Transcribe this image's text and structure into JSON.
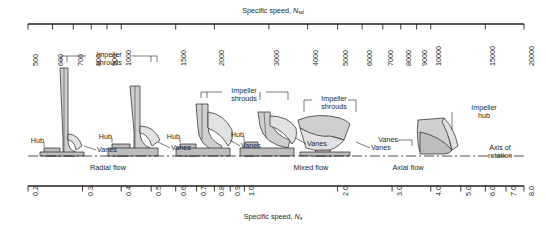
{
  "figure": {
    "top_axis": {
      "title_prefix": "Specific speed, ",
      "title_symbol": "N",
      "title_subscript": "sd",
      "ticks": [
        {
          "label": "500",
          "value": 500
        },
        {
          "label": "600",
          "value": 600
        },
        {
          "label": "700",
          "value": 700
        },
        {
          "label": "800",
          "value": 800
        },
        {
          "label": "900",
          "value": 900
        },
        {
          "label": "1000",
          "value": 1000
        },
        {
          "label": "1500",
          "value": 1500
        },
        {
          "label": "2000",
          "value": 2000
        },
        {
          "label": "3000",
          "value": 3000
        },
        {
          "label": "4000",
          "value": 4000
        },
        {
          "label": "5000",
          "value": 5000
        },
        {
          "label": "6000",
          "value": 6000
        },
        {
          "label": "7000",
          "value": 7000
        },
        {
          "label": "8000",
          "value": 8000
        },
        {
          "label": "9000",
          "value": 9000
        },
        {
          "label": "10000",
          "value": 10000
        },
        {
          "label": "15000",
          "value": 15000
        },
        {
          "label": "20000",
          "value": 20000
        }
      ]
    },
    "bottom_axis": {
      "title_prefix": "Specific speed, ",
      "title_symbol": "N",
      "title_subscript": "s",
      "ticks": [
        {
          "label": "0.2",
          "value": 0.2
        },
        {
          "label": "0.3",
          "value": 0.3
        },
        {
          "label": "0.4",
          "value": 0.4
        },
        {
          "label": "0.5",
          "value": 0.5
        },
        {
          "label": "0.6",
          "value": 0.6
        },
        {
          "label": "0.7",
          "value": 0.7
        },
        {
          "label": "0.8",
          "value": 0.8
        },
        {
          "label": "0.9",
          "value": 0.9
        },
        {
          "label": "1.0",
          "value": 1.0
        },
        {
          "label": "2.0",
          "value": 2.0
        },
        {
          "label": "3.0",
          "value": 3.0
        },
        {
          "label": "4.0",
          "value": 4.0
        },
        {
          "label": "5.0",
          "value": 5.0
        },
        {
          "label": "6.0",
          "value": 6.0
        },
        {
          "label": "7.0",
          "value": 7.0
        },
        {
          "label": "8.0",
          "value": 8.0
        }
      ]
    },
    "flow_regimes": [
      {
        "label": "Radial flow",
        "x": 108
      },
      {
        "label": "Mixed flow",
        "x": 311
      },
      {
        "label": "Axial flow",
        "x": 408
      }
    ],
    "annotations": {
      "impeller_shrouds_1": "Impeller\nshrouds",
      "impeller_shrouds_2": "Impeller\nshrouds",
      "impeller_shrouds_3": "Impeller\nshrouds",
      "impeller_hub": "Impeller\nhub",
      "axis_of_rotation": "Axis of\nrotation",
      "hub_1": "Hub",
      "hub_2": "Hub",
      "hub_3": "Hub",
      "hub_4": "Hub",
      "vanes_1": "Vanes",
      "vanes_2": "Vanes",
      "vanes_3": "Vanes",
      "vanes_4": "Vanes",
      "vanes_5": "Vanes",
      "vanes_6": "Vanes"
    },
    "colors": {
      "line": "#231f20",
      "text": "#231f20",
      "fill_light": "#e2e2e2",
      "fill_mid": "#cfcfcf",
      "fill_dark": "#bdbdbd",
      "background": "#ffffff"
    },
    "geometry": {
      "axis_left": 28,
      "axis_right": 524,
      "top_axis_y": 24,
      "bottom_axis_y": 186,
      "centerline_y": 156
    }
  }
}
